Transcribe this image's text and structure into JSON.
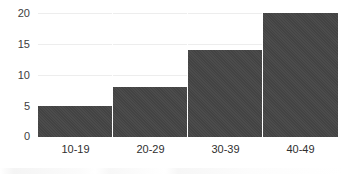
{
  "chart_data": {
    "type": "bar",
    "title": "",
    "title_note": "title is cropped off above the top edge of the image",
    "xlabel": "",
    "ylabel": "",
    "categories": [
      "10-19",
      "20-29",
      "30-39",
      "40-49"
    ],
    "values": [
      5,
      8,
      14,
      20
    ],
    "series": [
      {
        "name": "Frequency",
        "values": [
          5,
          8,
          14,
          20
        ]
      }
    ],
    "ylim": [
      0,
      20
    ],
    "yticks": [
      0,
      5,
      10,
      15,
      20
    ],
    "ytick_labels": [
      "0",
      "5",
      "10",
      "15",
      "20"
    ],
    "grid": true,
    "grid_axis": "y",
    "legend": false,
    "legend_position": "none",
    "bar_color": "#454545",
    "gridline_color": "#ededed",
    "background_color": "#ffffff",
    "bar_gap": "none",
    "orientation": "vertical"
  },
  "axes": {
    "y_ticks": [
      {
        "label": "20",
        "value": 20
      },
      {
        "label": "15",
        "value": 15
      },
      {
        "label": "10",
        "value": 10
      },
      {
        "label": "5",
        "value": 5
      },
      {
        "label": "0",
        "value": 0
      }
    ],
    "x_ticks": [
      {
        "label": "10-19"
      },
      {
        "label": "20-29"
      },
      {
        "label": "30-39"
      },
      {
        "label": "40-49"
      }
    ]
  },
  "bars": [
    {
      "category": "10-19",
      "value": 5
    },
    {
      "category": "20-29",
      "value": 8
    },
    {
      "category": "30-39",
      "value": 14
    },
    {
      "category": "40-49",
      "value": 20
    }
  ]
}
